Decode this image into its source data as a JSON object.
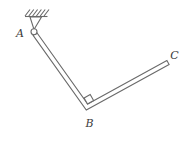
{
  "colors": {
    "line": "#6a6a6a",
    "label": "#3b3b3b",
    "background": "#ffffff"
  },
  "diagram": {
    "nodes": {
      "A": {
        "label": "A",
        "x": 34,
        "y": 32,
        "support": "pin to hatched ceiling"
      },
      "B": {
        "label": "B",
        "x": 87,
        "y": 107,
        "feature": "right-angle corner"
      },
      "C": {
        "label": "C",
        "x": 168,
        "y": 62.5,
        "feature": "free flat end"
      }
    },
    "members": [
      "AB",
      "BC"
    ],
    "angle_at_B_deg": 90,
    "bar_outline_points": "36.9,32.7 87.7,104.0 166.9,60.5 169.1,64.5 86.3,110.0 33.1,35.3",
    "right_angle_points": "87.5,104 93.6,100.6 90.2,94.5 84.1,97.9",
    "support": {
      "hatch_path": "M25,16 L30,9.5 M28.8,16 L33.8,9.5 M32.6,16 L37.6,9.5 M36.4,16 L41.4,9.5 M40.2,16 L45.2,9.5 M44,16 L49,9.5",
      "ground": {
        "x1": 25,
        "y1": 16.5,
        "x2": 47.5,
        "y2": 16.5
      },
      "bracket_points": "30,17 41.5,17 34,29.5"
    },
    "pin": {
      "cx": 34,
      "cy": 31.8,
      "r": 3
    }
  }
}
